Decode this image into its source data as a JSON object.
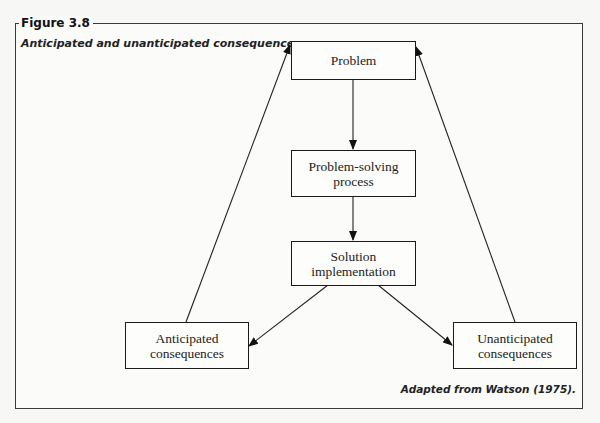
{
  "figure": {
    "label": "Figure 3.8",
    "caption": "Anticipated and unanticipated consequences.",
    "credit": "Adapted from Watson (1975)."
  },
  "nodes": {
    "problem": {
      "line1": "Problem"
    },
    "process": {
      "line1": "Problem-solving",
      "line2": "process"
    },
    "implementation": {
      "line1": "Solution",
      "line2": "implementation"
    },
    "anticipated": {
      "line1": "Anticipated",
      "line2": "consequences"
    },
    "unanticipated": {
      "line1": "Unanticipated",
      "line2": "consequences"
    }
  },
  "edges": [
    {
      "from": "problem",
      "to": "process"
    },
    {
      "from": "process",
      "to": "implementation"
    },
    {
      "from": "implementation",
      "to": "anticipated"
    },
    {
      "from": "implementation",
      "to": "unanticipated"
    },
    {
      "from": "anticipated",
      "to": "problem"
    },
    {
      "from": "unanticipated",
      "to": "problem"
    }
  ]
}
